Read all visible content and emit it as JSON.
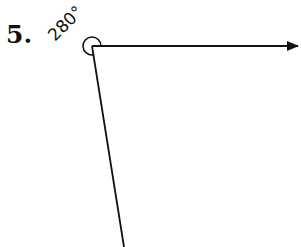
{
  "problem": {
    "number": "5.",
    "angle_label": "280°",
    "angle_degrees": 280
  },
  "diagram": {
    "vertex": [
      92,
      46
    ],
    "ray_right_end": [
      298,
      46
    ],
    "ray_down_end": [
      124,
      247
    ],
    "arc_radius": 9,
    "stroke_color": "#111111"
  }
}
